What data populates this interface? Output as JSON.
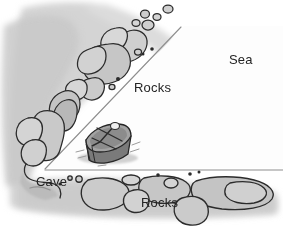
{
  "figure": {
    "name": "cove-map-illustration",
    "type": "hand-drawn map",
    "width": 283,
    "height": 227,
    "background_color": "#ffffff"
  },
  "labels": {
    "sea": "Sea",
    "rocks_upper": "Rocks",
    "rocks_lower": "Rocks",
    "cave": "Cave"
  },
  "colors": {
    "paper": "#ffffff",
    "sea_fill": "#fcfcfc",
    "land_halo": "#d2d2d2",
    "land_halo_soft": "#dedede",
    "rock_fill": "#c9c9c9",
    "rock_fill_light": "#dcdcdc",
    "rock_outline": "#2b2b2b",
    "guide_line": "#8d8d8d",
    "boat_hull": "#6f6f6f",
    "boat_inner": "#9a9a9a",
    "boat_outline": "#2a2a2a",
    "text": "#242424",
    "shadow": "#bdbdbd"
  },
  "geometry": {
    "triangle_apex": [
      45,
      169
    ],
    "diagonal_line": {
      "x1": 45,
      "y1": 169,
      "x2": 181,
      "y2": 27
    },
    "horizontal_line": {
      "x1": 45,
      "y1": 170,
      "x2": 283,
      "y2": 170
    }
  },
  "elements": {
    "boat": {
      "name": "rowing-boat",
      "position": [
        83,
        126
      ],
      "size": [
        52,
        40
      ],
      "description": "small rowing boat with oars, viewed at an angle"
    },
    "rock_clusters": [
      {
        "name": "upper-left-rock-chain",
        "description": "diagonal chain of rocks along the upper-left shoreline"
      },
      {
        "name": "left-rock-chain",
        "description": "rocks along the left edge descending to the cave"
      },
      {
        "name": "lower-rock-chain",
        "description": "row of rocks along the bottom shoreline"
      }
    ]
  }
}
